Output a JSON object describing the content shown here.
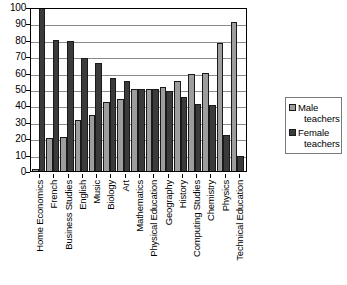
{
  "chart_data": {
    "type": "bar",
    "title": "",
    "subtitle": "",
    "xlabel": "",
    "ylabel": "",
    "ylim": [
      0,
      100
    ],
    "ytick_step": 10,
    "yticks": [
      100,
      90,
      80,
      70,
      60,
      50,
      40,
      30,
      20,
      10,
      0
    ],
    "grid": "horizontal",
    "grid_on": true,
    "legend_position": "right",
    "orientation": "vertical",
    "grouping": "grouped",
    "categories": [
      "Home Economics",
      "French",
      "Business Studies",
      "English",
      "Music",
      "Biology",
      "Art",
      "Mathematics",
      "Physical Education",
      "Geography",
      "History",
      "Computing Studies",
      "Chemistry",
      "Physics",
      "Technical Education"
    ],
    "series": [
      {
        "name": "Male teachers",
        "color": "#9d9d9d",
        "values": [
          1,
          20,
          21,
          31,
          34,
          42,
          44,
          50,
          50,
          51,
          55,
          59,
          60,
          78,
          91
        ]
      },
      {
        "name": "Female teachers",
        "color": "#3b3b3b",
        "values": [
          100,
          80,
          79,
          69,
          66,
          57,
          55,
          50,
          50,
          49,
          45,
          41,
          40,
          22,
          9
        ]
      }
    ]
  },
  "legend": {
    "items": [
      {
        "label": "Male teachers",
        "word1": "Male",
        "word2": "teachers",
        "swatch": "male"
      },
      {
        "label": "Female teachers",
        "word1": "Female",
        "word2": "teachers",
        "swatch": "female"
      }
    ]
  },
  "colors": {
    "male": "#9d9d9d",
    "female": "#3b3b3b",
    "axis": "#000000",
    "gridline": "#8a8a8a",
    "background": "#ffffff",
    "legend_border": "#7a7a7a"
  }
}
